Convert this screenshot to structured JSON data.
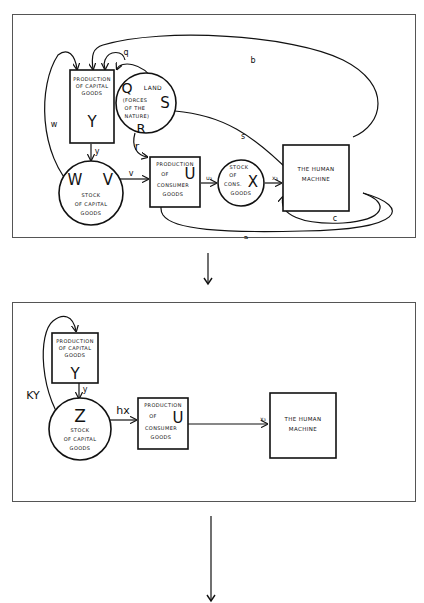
{
  "diagram1": {
    "nodes": {
      "capital_production": {
        "lines": [
          "PRODUCTION",
          "OF CAPITAL",
          "GOODS"
        ],
        "symbol": "Y"
      },
      "land": {
        "title": "LAND",
        "lines": [
          "(FORCES",
          "OF THE",
          "NATURE)"
        ],
        "symbol_top": "Q",
        "symbol_right": "S",
        "symbol_bottom": "R"
      },
      "capital_stock": {
        "lines": [
          "STOCK",
          "OF CAPITAL",
          "GOODS"
        ],
        "symbol_left": "W",
        "symbol_right": "V"
      },
      "consumer_production": {
        "lines": [
          "PRODUCTION",
          "OF",
          "CONSUMER",
          "GOODS"
        ],
        "symbol": "U"
      },
      "consumer_stock": {
        "lines": [
          "STOCK",
          "OF",
          "CONS.",
          "GOODS"
        ],
        "symbol": "X"
      },
      "human_machine": {
        "lines": [
          "THE HUMAN",
          "MACHINE"
        ]
      }
    },
    "edges": {
      "b": "b",
      "q": "q",
      "w": "w",
      "y": "y",
      "r": "r",
      "v": "v",
      "s": "s",
      "u3": "u₃",
      "x3": "x₃",
      "c": "c",
      "a": "a"
    }
  },
  "arrow1": {
    "direction": "down"
  },
  "diagram2": {
    "nodes": {
      "capital_production": {
        "lines": [
          "PRODUCTION",
          "OF CAPITAL",
          "GOODS"
        ],
        "symbol": "Y"
      },
      "capital_stock": {
        "lines": [
          "STOCK",
          "OF CAPITAL",
          "GOODS"
        ],
        "symbol": "Z"
      },
      "consumer_production": {
        "lines": [
          "PRODUCTION",
          "OF",
          "CONSUMER",
          "GOODS"
        ],
        "symbol": "U"
      },
      "human_machine": {
        "lines": [
          "THE HUMAN",
          "MACHINE"
        ]
      }
    },
    "edges": {
      "ky": "KY",
      "y": "y",
      "hx": "hx",
      "x3": "x₃"
    }
  },
  "arrow2": {
    "direction": "down"
  }
}
